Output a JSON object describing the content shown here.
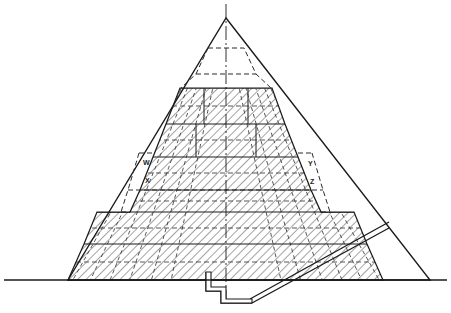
{
  "figure": {
    "name": "pyramid-cross-section"
  },
  "colors": {
    "background": "#ffffff",
    "ink": "#1a1a1a",
    "hatch": "#555555",
    "dashed": "#333333",
    "ground": "#1a1a1a"
  },
  "labels": [
    {
      "id": "w",
      "text": "W",
      "x": 143,
      "y": 162
    },
    {
      "id": "x",
      "text": "X",
      "x": 145,
      "y": 180
    },
    {
      "id": "y",
      "text": "Y",
      "x": 310,
      "y": 163
    },
    {
      "id": "z",
      "text": "Z",
      "x": 312,
      "y": 181
    }
  ],
  "geometry": {
    "apex": {
      "x": 226,
      "y": 18
    },
    "baseline": {
      "y": 280,
      "x_start": 4,
      "x_end": 447
    },
    "outer_base": {
      "left": 68,
      "right": 430
    },
    "axis": {
      "x": 226,
      "y_top": 4,
      "y_bottom": 300
    },
    "step_tiers": [
      {
        "level": 1,
        "top_y": 88,
        "top_left": 180,
        "top_right": 272,
        "bottom_y": 124,
        "bottom_left": 166,
        "bottom_right": 285
      },
      {
        "level": 2,
        "top_y": 124,
        "top_left": 166,
        "top_right": 285,
        "bottom_y": 157,
        "bottom_left": 153,
        "bottom_right": 298
      },
      {
        "level": 3,
        "top_y": 157,
        "top_left": 153,
        "top_right": 298,
        "bottom_y": 190,
        "bottom_left": 140,
        "bottom_right": 311
      },
      {
        "level": 4,
        "top_y": 190,
        "top_left": 140,
        "top_right": 311,
        "bottom_y": 212,
        "bottom_left": 130,
        "bottom_right": 321
      },
      {
        "level": 5,
        "top_y": 212,
        "top_left": 97,
        "top_right": 354,
        "bottom_y": 244,
        "bottom_left": 84,
        "bottom_right": 367
      },
      {
        "level": 6,
        "top_y": 244,
        "top_left": 84,
        "top_right": 367,
        "bottom_y": 280,
        "bottom_left": 68,
        "bottom_right": 383
      }
    ],
    "dashed_phases": [
      {
        "id": "phase-apex-1",
        "top_y": 48,
        "top_left": 208,
        "top_right": 244,
        "bottom_y": 74,
        "bottom_left": 196,
        "bottom_right": 256
      },
      {
        "id": "phase-apex-2",
        "top_y": 74,
        "top_left": 196,
        "top_right": 256,
        "bottom_y": 88,
        "bottom_left": 181,
        "bottom_right": 271
      },
      {
        "id": "phase-w",
        "top_y": 153,
        "top_left": 139,
        "top_right": 312,
        "bottom_y": 190,
        "bottom_left": 128,
        "bottom_right": 323
      },
      {
        "id": "phase-x",
        "top_y": 190,
        "top_left": 128,
        "top_right": 323,
        "bottom_y": 212,
        "bottom_left": 121,
        "bottom_right": 330
      }
    ],
    "passage": {
      "name": "descending-passage",
      "start": {
        "x": 388,
        "y": 224
      },
      "end": {
        "x": 250,
        "y": 300
      }
    },
    "shaft": {
      "name": "substructure-shaft",
      "points": "206,272 206,290 221,290 221,302 250,302"
    }
  },
  "annotations": {
    "hatch_style": "diagonal-45",
    "grid_style": "dashed-accretion-layers",
    "axis_style": "dash-dot-centerline"
  }
}
